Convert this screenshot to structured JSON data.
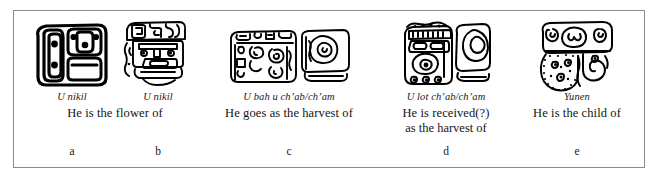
{
  "figure": {
    "type": "maya-glyph-relationship-chart",
    "border_color": "#8b8b8b",
    "background": "#ffffff",
    "ink_color": "#000000",
    "columns": [
      {
        "key": "a",
        "glyph_name": "glyph-u-nikil-full-figure",
        "transliteration": "U nikil",
        "gloss_line1": "He is the flower of",
        "gloss_line2": ""
      },
      {
        "key": "b",
        "glyph_name": "glyph-u-nikil-head-variant",
        "transliteration": "U nikil",
        "gloss_line1": "",
        "gloss_line2": ""
      },
      {
        "key": "c",
        "glyph_name": "glyph-u-bah-u-chab-cham",
        "transliteration": "U bah u ch’ab/ch’am",
        "gloss_line1": "He goes as the harvest of",
        "gloss_line2": ""
      },
      {
        "key": "d",
        "glyph_name": "glyph-u-lot-chab-cham",
        "transliteration": "U lot ch’ab/ch’am",
        "gloss_line1": "He is received(?)",
        "gloss_line2": "as the harvest of"
      },
      {
        "key": "e",
        "glyph_name": "glyph-yunen",
        "transliteration": "Yunen",
        "gloss_line1": "He is the child of",
        "gloss_line2": ""
      }
    ],
    "shared_gloss_ab": "He is the flower of",
    "key_letters": [
      "a",
      "b",
      "c",
      "d",
      "e"
    ]
  }
}
